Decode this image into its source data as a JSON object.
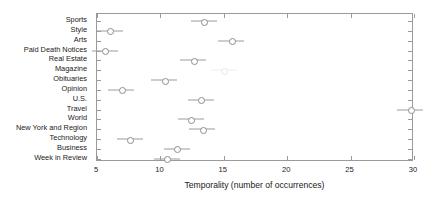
{
  "chart_data": {
    "type": "scatter",
    "title": "",
    "xlabel": "Temporality (number of occurrences)",
    "ylabel": "",
    "xlim": [
      5,
      30
    ],
    "ylim": [
      0,
      15
    ],
    "grid": false,
    "legend": null,
    "xticks": [
      "5",
      "10",
      "15",
      "20",
      "25",
      "30"
    ],
    "categories": [
      "Sports",
      "Style",
      "Arts",
      "Paid Death Notices",
      "Real Estate",
      "Magazine",
      "Obituaries",
      "Opinion",
      "U.S.",
      "Travel",
      "World",
      "New York and Region",
      "Technology",
      "Business",
      "Week in Review"
    ],
    "values": [
      13.4,
      6.0,
      15.6,
      5.6,
      12.6,
      15.0,
      10.3,
      6.9,
      13.2,
      29.7,
      12.4,
      13.3,
      7.6,
      11.3,
      10.5
    ],
    "points": [
      {
        "category": "Sports",
        "value": 13.4,
        "faint": false
      },
      {
        "category": "Style",
        "value": 6.0,
        "faint": false
      },
      {
        "category": "Arts",
        "value": 15.6,
        "faint": false
      },
      {
        "category": "Paid Death Notices",
        "value": 5.6,
        "faint": false
      },
      {
        "category": "Real Estate",
        "value": 12.6,
        "faint": false
      },
      {
        "category": "Magazine",
        "value": 15.0,
        "faint": true
      },
      {
        "category": "Obituaries",
        "value": 10.3,
        "faint": false
      },
      {
        "category": "Opinion",
        "value": 6.9,
        "faint": false
      },
      {
        "category": "U.S.",
        "value": 13.2,
        "faint": false
      },
      {
        "category": "Travel",
        "value": 29.7,
        "faint": false
      },
      {
        "category": "World",
        "value": 12.4,
        "faint": false
      },
      {
        "category": "New York and Region",
        "value": 13.3,
        "faint": false
      },
      {
        "category": "Technology",
        "value": 7.6,
        "faint": false
      },
      {
        "category": "Business",
        "value": 11.3,
        "faint": false
      },
      {
        "category": "Week in Review",
        "value": 10.5,
        "faint": false
      }
    ],
    "marker_style": "open-circle-with-horizontal-whisker",
    "colors": {
      "axis": "#9a9a9a",
      "marker": "#8d8d8d",
      "whisker": "#9b9b9b",
      "text": "#1a1a1a",
      "background": "#ffffff"
    }
  }
}
